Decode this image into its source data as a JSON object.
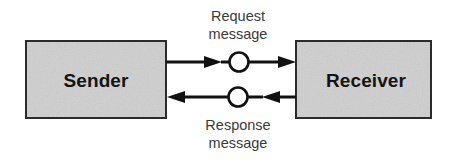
{
  "diagram": {
    "background_color": "#ffffff",
    "nodes": [
      {
        "id": "sender",
        "label": "Sender",
        "shape": "rectangle",
        "fill_color": "#cfcfcf",
        "border_color": "#2b2b2b",
        "x": 26,
        "y": 41,
        "width": 140,
        "height": 77
      },
      {
        "id": "receiver",
        "label": "Receiver",
        "shape": "rectangle",
        "fill_color": "#cfcfcf",
        "border_color": "#2b2b2b",
        "x": 296,
        "y": 41,
        "width": 135,
        "height": 77
      }
    ],
    "junctions": [
      {
        "id": "request-junction",
        "shape": "circle",
        "fill_color": "#ffffff",
        "border_color": "#111111",
        "cx": 239,
        "cy": 62,
        "r": 9.5
      },
      {
        "id": "response-junction",
        "shape": "circle",
        "fill_color": "#ffffff",
        "border_color": "#111111",
        "cx": 238,
        "cy": 97,
        "r": 9.5
      }
    ],
    "edges": [
      {
        "id": "request-flow",
        "from": "sender",
        "to": "receiver",
        "direction": "left-to-right",
        "label_line1": "Request",
        "label_line2": "message",
        "label_position": "above",
        "color": "#111111"
      },
      {
        "id": "response-flow",
        "from": "receiver",
        "to": "sender",
        "direction": "right-to-left",
        "label_line1": "Response",
        "label_line2": "message",
        "label_position": "below",
        "color": "#111111"
      }
    ]
  }
}
